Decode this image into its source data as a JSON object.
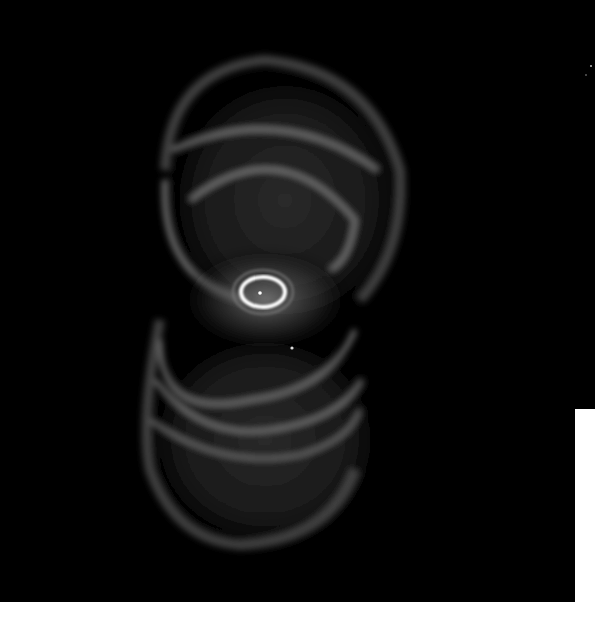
{
  "image": {
    "subject": "Hourglass-shaped planetary nebula",
    "description": "Grayscale astronomical image of a bipolar nebula with two stacked ring-shaped lobes and a bright elliptical ring with a central star at the waist",
    "colors": {
      "background": "#000000",
      "border": "#ffffff",
      "nebula_glow": "#9a9a9a",
      "core_ring": "#ffffff"
    },
    "features": [
      {
        "name": "upper-lobe",
        "center": [
          285,
          220
        ],
        "approx_radius": [
          120,
          150
        ]
      },
      {
        "name": "lower-lobe",
        "center": [
          265,
          430
        ],
        "approx_radius": [
          120,
          130
        ]
      },
      {
        "name": "central-ring",
        "center": [
          263,
          292
        ],
        "approx_radius": [
          22,
          14
        ]
      },
      {
        "name": "central-star",
        "center": [
          260,
          293
        ]
      },
      {
        "name": "field-star",
        "center": [
          292,
          348
        ]
      }
    ]
  }
}
